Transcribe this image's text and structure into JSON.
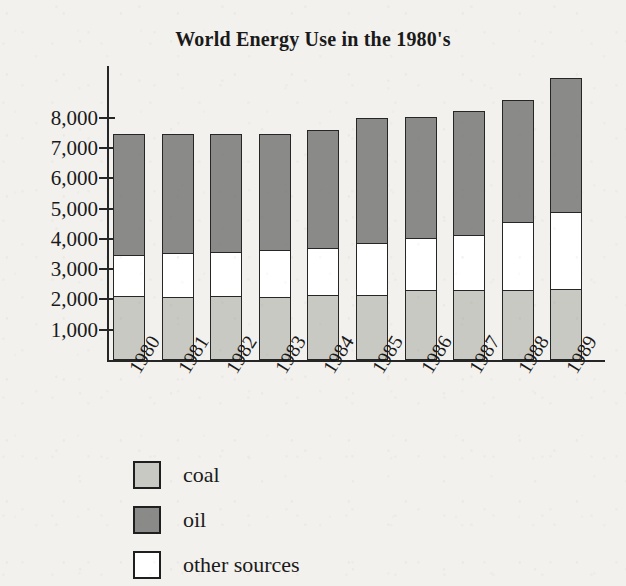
{
  "chart_data": {
    "type": "bar",
    "subtype": "stacked-bar",
    "title": "World Energy Use in the 1980's",
    "xlabel": "",
    "ylabel": "",
    "ylim": [
      0,
      9500
    ],
    "grid": false,
    "legend_position": "below-left",
    "y_ticks": [
      "1,000",
      "2,000",
      "3,000",
      "4,000",
      "5,000",
      "6,000",
      "7,000",
      "8,000"
    ],
    "y_tick_values": [
      1000,
      2000,
      3000,
      4000,
      5000,
      6000,
      7000,
      8000
    ],
    "categories": [
      "1980",
      "1981",
      "1982",
      "1983",
      "1984",
      "1985",
      "1986",
      "1987",
      "1988",
      "1989"
    ],
    "series": [
      {
        "name": "coal",
        "color": "#c9c9c4",
        "values": [
          2100,
          2090,
          2110,
          2090,
          2130,
          2130,
          2300,
          2310,
          2320,
          2330
        ]
      },
      {
        "name": "other sources",
        "color": "#ffffff",
        "values": [
          1430,
          1500,
          1520,
          1580,
          1610,
          1790,
          1790,
          1880,
          2280,
          2620
        ]
      },
      {
        "name": "oil",
        "color": "#8a8a88",
        "values": [
          4020,
          3960,
          3920,
          3880,
          3960,
          4180,
          4020,
          4120,
          4080,
          4450
        ]
      }
    ],
    "totals": [
      7550,
      7550,
      7550,
      7550,
      7700,
      8100,
      8110,
      8310,
      8680,
      9400
    ],
    "stack_order_bottom_to_top": [
      "coal",
      "other sources",
      "oil"
    ]
  },
  "legend": {
    "items": [
      {
        "label": "coal",
        "swatch": "coal"
      },
      {
        "label": "oil",
        "swatch": "oil"
      },
      {
        "label": "other sources",
        "swatch": "other"
      }
    ]
  }
}
